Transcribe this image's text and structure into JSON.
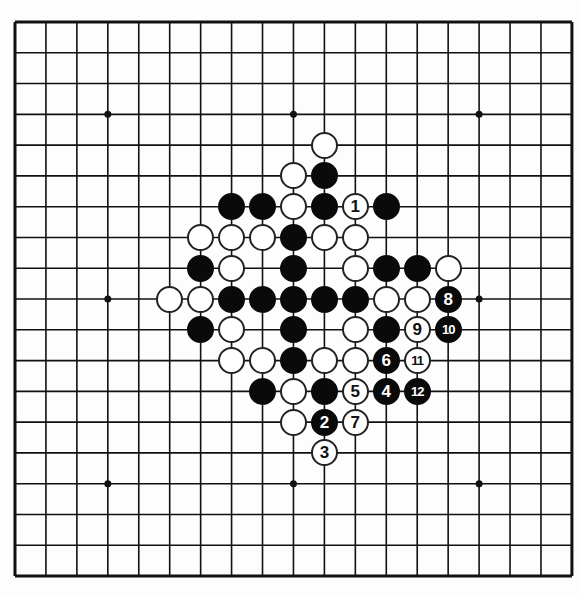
{
  "board": {
    "size": 19,
    "origin_x": 15,
    "origin_y": 22,
    "spacing_x": 30.94,
    "spacing_y": 30.78,
    "star_points": [
      [
        3,
        3
      ],
      [
        9,
        3
      ],
      [
        15,
        3
      ],
      [
        3,
        9
      ],
      [
        9,
        9
      ],
      [
        15,
        9
      ],
      [
        3,
        15
      ],
      [
        9,
        15
      ],
      [
        15,
        15
      ]
    ],
    "line_color": "#111111",
    "background": "#fdfdfd"
  },
  "stones": {
    "black": [
      [
        10,
        5
      ],
      [
        7,
        6
      ],
      [
        8,
        6
      ],
      [
        10,
        6
      ],
      [
        12,
        6
      ],
      [
        9,
        7
      ],
      [
        6,
        8
      ],
      [
        9,
        8
      ],
      [
        12,
        8
      ],
      [
        13,
        8
      ],
      [
        7,
        9
      ],
      [
        8,
        9
      ],
      [
        9,
        9
      ],
      [
        10,
        9
      ],
      [
        11,
        9
      ],
      [
        6,
        10
      ],
      [
        9,
        10
      ],
      [
        12,
        10
      ],
      [
        9,
        11
      ],
      [
        8,
        12
      ],
      [
        10,
        12
      ]
    ],
    "white": [
      [
        10,
        4
      ],
      [
        9,
        5
      ],
      [
        9,
        6
      ],
      [
        6,
        7
      ],
      [
        7,
        7
      ],
      [
        8,
        7
      ],
      [
        10,
        7
      ],
      [
        11,
        7
      ],
      [
        7,
        8
      ],
      [
        11,
        8
      ],
      [
        14,
        8
      ],
      [
        5,
        9
      ],
      [
        6,
        9
      ],
      [
        12,
        9
      ],
      [
        13,
        9
      ],
      [
        7,
        10
      ],
      [
        11,
        10
      ],
      [
        7,
        11
      ],
      [
        8,
        11
      ],
      [
        10,
        11
      ],
      [
        11,
        11
      ],
      [
        9,
        12
      ],
      [
        9,
        13
      ]
    ]
  },
  "moves": [
    {
      "number": "1",
      "color": "white",
      "col": 11,
      "row": 6
    },
    {
      "number": "2",
      "color": "black",
      "col": 10,
      "row": 13
    },
    {
      "number": "3",
      "color": "white",
      "col": 10,
      "row": 14
    },
    {
      "number": "4",
      "color": "black",
      "col": 12,
      "row": 12
    },
    {
      "number": "5",
      "color": "white",
      "col": 11,
      "row": 12
    },
    {
      "number": "6",
      "color": "black",
      "col": 12,
      "row": 11
    },
    {
      "number": "7",
      "color": "white",
      "col": 11,
      "row": 13
    },
    {
      "number": "8",
      "color": "black",
      "col": 14,
      "row": 9
    },
    {
      "number": "9",
      "color": "white",
      "col": 13,
      "row": 10
    },
    {
      "number": "10",
      "color": "black",
      "col": 14,
      "row": 10
    },
    {
      "number": "11",
      "color": "white",
      "col": 13,
      "row": 11
    },
    {
      "number": "12",
      "color": "black",
      "col": 13,
      "row": 12
    }
  ]
}
